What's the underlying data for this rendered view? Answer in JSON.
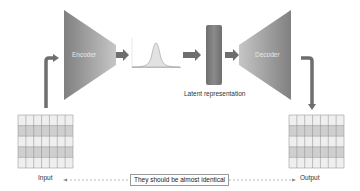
{
  "diagram": {
    "type": "autoencoder",
    "encoder": {
      "label": "Encoder"
    },
    "decoder": {
      "label": "Decoder"
    },
    "latent": {
      "label": "Latent representation"
    },
    "distribution": {
      "shape": "gaussian"
    },
    "input": {
      "label": "Input",
      "grid": {
        "cols": 7,
        "rows": 5
      }
    },
    "output": {
      "label": "Output",
      "grid": {
        "cols": 7,
        "rows": 5
      }
    },
    "comparison": {
      "label": "They should be almost identical"
    },
    "colors": {
      "block_dark": "#7a7a7a",
      "block_light": "#c4c4c4",
      "arrow": "#6e6e6e",
      "grid_light": "#eeeeee",
      "grid_dark": "#cfcfcf",
      "grid_line": "#8a8a8a",
      "gaussian_fill": "#e0e0e0"
    }
  }
}
